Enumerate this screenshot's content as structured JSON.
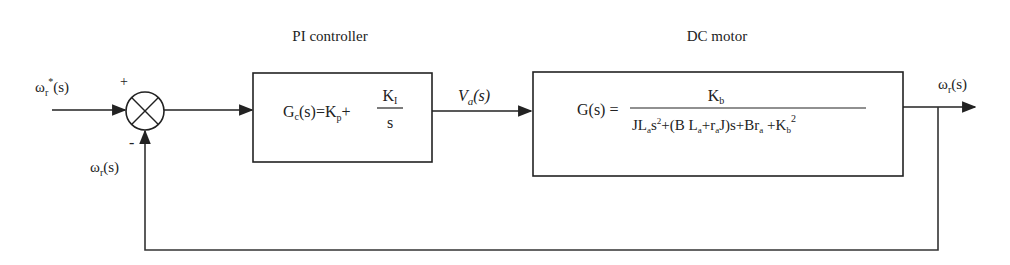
{
  "diagram": {
    "type": "control-block-diagram",
    "colors": {
      "line": "#333333",
      "text": "#222222",
      "background": "#ffffff"
    },
    "blocks": [
      {
        "id": "pi-controller",
        "title": "PI controller",
        "equation_lhs": "Gc(s)=Kp+",
        "equation_lhs_parts": {
          "G": "G",
          "sub": "c",
          "args": "(s)=K",
          "p": "p",
          "plus": "+"
        },
        "fraction": {
          "numerator": "K",
          "numerator_sub": "I",
          "denominator": "s"
        }
      },
      {
        "id": "dc-motor",
        "title": "DC motor",
        "equation_lhs": "G(s) =",
        "fraction": {
          "numerator": "K",
          "numerator_sub": "b",
          "denominator": "JLa s^2 + (B La + ra J) s + Bra + Kb^2"
        }
      }
    ],
    "summing_junction": {
      "plus_sign": "+",
      "minus_sign": "-"
    },
    "signals": {
      "reference": {
        "text": "ωr*(s)",
        "base": "ω",
        "sub": "r",
        "sup": "*",
        "arg": "(s)"
      },
      "feedback": {
        "text": "ωr(s)",
        "base": "ω",
        "sub": "r",
        "arg": "(s)"
      },
      "control": {
        "text": "Va(s)",
        "base": "V",
        "sub": "a",
        "arg": "(s)"
      },
      "output": {
        "text": "ωr(s)",
        "base": "ω",
        "sub": "r",
        "arg": "(s)"
      }
    }
  }
}
